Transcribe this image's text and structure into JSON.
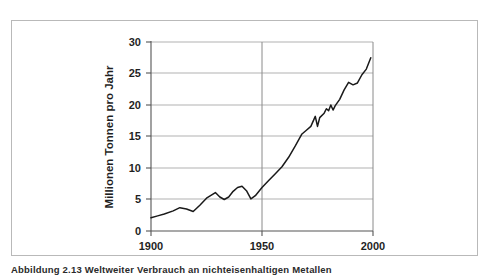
{
  "figure": {
    "caption": "Abbildung 2.13 Weltweiter Verbrauch an nichteisenhaltigen Metallen"
  },
  "chart_data": {
    "type": "line",
    "title": "",
    "xlabel": "",
    "ylabel": "Millionen Tonnen pro Jahr",
    "xlim": [
      1900,
      2000
    ],
    "ylim": [
      0,
      30
    ],
    "xticks": [
      1900,
      1950,
      2000
    ],
    "xticklabels": [
      "1900",
      "1950",
      "2000"
    ],
    "yticks": [
      0,
      5,
      10,
      15,
      20,
      25,
      30
    ],
    "yticklabels": [
      "0",
      "5",
      "10",
      "15",
      "20",
      "25",
      "30"
    ],
    "grid": {
      "horizontal": true,
      "vertical": true,
      "vertical_at": [
        1950
      ]
    },
    "legend": null,
    "line_color": "#1a1a1a",
    "grid_color": "#a8a8a8",
    "axis_color": "#555555",
    "series": [
      {
        "name": "Weltweiter Verbrauch an nichteisenhaltigen Metallen",
        "x": [
          1900,
          1903,
          1906,
          1910,
          1913,
          1916,
          1919,
          1922,
          1925,
          1929,
          1931,
          1933,
          1935,
          1937,
          1939,
          1941,
          1943,
          1945,
          1947,
          1950,
          1953,
          1956,
          1959,
          1962,
          1965,
          1968,
          1970,
          1972,
          1974,
          1975,
          1976,
          1978,
          1979,
          1980,
          1981,
          1982,
          1983,
          1985,
          1987,
          1989,
          1991,
          1993,
          1995,
          1997,
          1999
        ],
        "y": [
          2.1,
          2.4,
          2.7,
          3.2,
          3.7,
          3.5,
          3.1,
          4.1,
          5.2,
          6.1,
          5.4,
          5.0,
          5.4,
          6.3,
          6.9,
          7.1,
          6.4,
          5.1,
          5.6,
          6.9,
          8.0,
          9.1,
          10.2,
          11.7,
          13.5,
          15.4,
          16.0,
          16.6,
          18.2,
          16.6,
          18.0,
          18.7,
          19.4,
          19.1,
          20.0,
          19.2,
          19.9,
          20.9,
          22.4,
          23.6,
          23.2,
          23.5,
          24.8,
          25.7,
          27.5
        ]
      }
    ]
  }
}
